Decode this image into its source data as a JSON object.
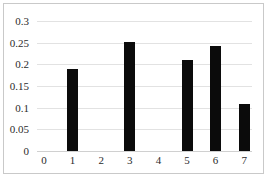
{
  "chart_data": {
    "type": "bar",
    "title": "",
    "subtitle": "",
    "xlabel": "",
    "ylabel": "",
    "categories": [
      "0",
      "1",
      "2",
      "3",
      "4",
      "5",
      "6",
      "7"
    ],
    "values": [
      0,
      0.19,
      0,
      0.252,
      0,
      0.211,
      0.242,
      0.109
    ],
    "series": [
      {
        "name": "",
        "values": [
          0,
          0.19,
          0,
          0.252,
          0,
          0.211,
          0.242,
          0.109
        ]
      }
    ],
    "ylim": [
      0,
      0.3
    ],
    "xlim": [
      0,
      7
    ],
    "ytick_labels": [
      "0",
      "0.05",
      "0.1",
      "0.15",
      "0.2",
      "0.25",
      "0.3"
    ],
    "ytick_values": [
      0,
      0.05,
      0.1,
      0.15,
      0.2,
      0.25,
      0.3
    ],
    "xtick_labels": [
      "0",
      "1",
      "2",
      "3",
      "4",
      "5",
      "6",
      "7"
    ],
    "grid": "horizontal",
    "legend": "none",
    "bar_color": "#0b0b0b",
    "gridline_color": "#e2e2e2",
    "border_color": "#c9c9c9",
    "background_color": "#ffffff",
    "annotations": []
  }
}
